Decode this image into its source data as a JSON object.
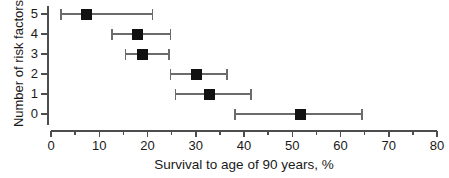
{
  "chart_data": {
    "type": "scatter",
    "title": "",
    "xlabel": "Survival to age of 90 years, %",
    "ylabel": "Number of risk factors",
    "xlim": [
      0,
      80
    ],
    "ylim": [
      -0.5,
      5.5
    ],
    "grid": false,
    "legend": null,
    "x_ticks": [
      0,
      10,
      20,
      30,
      40,
      50,
      60,
      70,
      80
    ],
    "x_tick_labels": [
      "0",
      "10",
      "20",
      "30",
      "40",
      "50",
      "60",
      "70",
      "80"
    ],
    "x_minor_ticks": [
      5,
      15,
      25,
      35,
      45,
      55,
      65,
      75
    ],
    "y_ticks": [
      5,
      4,
      3,
      2,
      1,
      0
    ],
    "y_tick_labels": [
      "5",
      "4",
      "3",
      "2",
      "1",
      "0"
    ],
    "orientation": "horizontal",
    "marker": "square",
    "marker_color": "#111111",
    "errorbar_color": "#6b6b6b",
    "categories": [
      "5",
      "4",
      "3",
      "2",
      "1",
      "0"
    ],
    "values": [
      7.3,
      17.9,
      19.0,
      30.2,
      32.9,
      51.7
    ],
    "error_low": [
      2.1,
      12.7,
      15.4,
      24.8,
      25.8,
      38.1
    ],
    "error_high": [
      21.0,
      24.8,
      24.4,
      36.5,
      41.5,
      64.4
    ],
    "points": [
      {
        "category": "5",
        "value": 7.3,
        "ci_low": 2.1,
        "ci_high": 21.0
      },
      {
        "category": "4",
        "value": 17.9,
        "ci_low": 12.7,
        "ci_high": 24.8
      },
      {
        "category": "3",
        "value": 19.0,
        "ci_low": 15.4,
        "ci_high": 24.4
      },
      {
        "category": "2",
        "value": 30.2,
        "ci_low": 24.8,
        "ci_high": 36.5
      },
      {
        "category": "1",
        "value": 32.9,
        "ci_low": 25.8,
        "ci_high": 41.5
      },
      {
        "category": "0",
        "value": 51.7,
        "ci_low": 38.1,
        "ci_high": 64.4
      }
    ]
  },
  "axes": {
    "x_title": "Survival to age of 90 years, %",
    "y_title": "Number of risk factors"
  }
}
